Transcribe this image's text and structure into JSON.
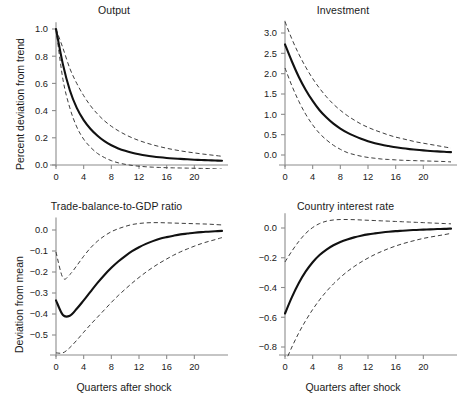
{
  "figure": {
    "width": 458,
    "height": 404,
    "background": "#ffffff",
    "axis_color": "#8c8c8c",
    "mean_color": "#111111",
    "band_color": "#333333"
  },
  "chart_data": [
    {
      "type": "line",
      "panel": "top-left",
      "title": "Output",
      "xlabel": "",
      "ylabel": "Percent deviation from trend",
      "xlim": [
        0,
        24
      ],
      "ylim": [
        -0.08,
        1.05
      ],
      "xticks": [
        0,
        4,
        8,
        12,
        16,
        20
      ],
      "xticklabels": [
        "0",
        "4",
        "8",
        "12",
        "16",
        "20"
      ],
      "yticks": [
        0.0,
        0.2,
        0.4,
        0.6,
        0.8,
        1.0
      ],
      "yticklabels": [
        "0.0",
        "0.2",
        "0.4",
        "0.6",
        "0.8",
        "1.0"
      ],
      "grid": false,
      "legend": "none",
      "x": [
        0,
        1,
        2,
        3,
        4,
        5,
        6,
        7,
        8,
        9,
        10,
        11,
        12,
        13,
        14,
        15,
        16,
        17,
        18,
        19,
        20,
        21,
        22,
        23,
        24
      ],
      "series": [
        {
          "name": "mean",
          "style": "solid",
          "values": [
            1.0,
            0.74,
            0.55,
            0.42,
            0.33,
            0.265,
            0.215,
            0.175,
            0.145,
            0.122,
            0.104,
            0.09,
            0.079,
            0.07,
            0.063,
            0.057,
            0.052,
            0.048,
            0.045,
            0.042,
            0.039,
            0.037,
            0.035,
            0.033,
            0.031
          ]
        },
        {
          "name": "upper-band",
          "style": "dashed",
          "values": [
            1.0,
            0.86,
            0.71,
            0.6,
            0.51,
            0.435,
            0.375,
            0.325,
            0.285,
            0.252,
            0.224,
            0.2,
            0.18,
            0.163,
            0.148,
            0.135,
            0.123,
            0.113,
            0.104,
            0.096,
            0.089,
            0.082,
            0.076,
            0.07,
            0.064
          ]
        },
        {
          "name": "lower-band",
          "style": "dashed",
          "values": [
            1.0,
            0.63,
            0.42,
            0.28,
            0.19,
            0.13,
            0.085,
            0.055,
            0.032,
            0.016,
            0.005,
            -0.003,
            -0.009,
            -0.013,
            -0.016,
            -0.018,
            -0.02,
            -0.021,
            -0.022,
            -0.023,
            -0.024,
            -0.025,
            -0.026,
            -0.028,
            -0.031
          ]
        }
      ]
    },
    {
      "type": "line",
      "panel": "top-right",
      "title": "Investment",
      "xlabel": "",
      "ylabel": "",
      "xlim": [
        0,
        24
      ],
      "ylim": [
        -0.25,
        3.3
      ],
      "xticks": [
        0,
        4,
        8,
        12,
        16,
        20
      ],
      "xticklabels": [
        "0",
        "4",
        "8",
        "12",
        "16",
        "20"
      ],
      "yticks": [
        0.0,
        0.5,
        1.0,
        1.5,
        2.0,
        2.5,
        3.0
      ],
      "yticklabels": [
        "0.0",
        "0.5",
        "1.0",
        "1.5",
        "2.0",
        "2.5",
        "3.0"
      ],
      "grid": false,
      "legend": "none",
      "x": [
        0,
        1,
        2,
        3,
        4,
        5,
        6,
        7,
        8,
        9,
        10,
        11,
        12,
        13,
        14,
        15,
        16,
        17,
        18,
        19,
        20,
        21,
        22,
        23,
        24
      ],
      "series": [
        {
          "name": "mean",
          "style": "solid",
          "values": [
            2.72,
            2.3,
            1.92,
            1.6,
            1.33,
            1.1,
            0.92,
            0.77,
            0.65,
            0.55,
            0.47,
            0.4,
            0.34,
            0.29,
            0.25,
            0.22,
            0.19,
            0.165,
            0.145,
            0.128,
            0.113,
            0.1,
            0.089,
            0.079,
            0.07
          ]
        },
        {
          "name": "upper-band",
          "style": "dashed",
          "values": [
            3.28,
            2.85,
            2.48,
            2.16,
            1.88,
            1.64,
            1.43,
            1.25,
            1.1,
            0.97,
            0.86,
            0.76,
            0.68,
            0.61,
            0.55,
            0.49,
            0.44,
            0.4,
            0.36,
            0.32,
            0.29,
            0.26,
            0.23,
            0.2,
            0.17
          ]
        },
        {
          "name": "lower-band",
          "style": "dashed",
          "values": [
            2.14,
            1.7,
            1.32,
            1.0,
            0.74,
            0.53,
            0.37,
            0.24,
            0.14,
            0.06,
            0.01,
            -0.03,
            -0.06,
            -0.08,
            -0.1,
            -0.11,
            -0.12,
            -0.13,
            -0.135,
            -0.14,
            -0.145,
            -0.15,
            -0.155,
            -0.16,
            -0.17
          ]
        }
      ]
    },
    {
      "type": "line",
      "panel": "bottom-left",
      "title": "Trade-balance-to-GDP ratio",
      "xlabel": "Quarters after shock",
      "ylabel": "Deviation from mean",
      "xlim": [
        0,
        24
      ],
      "ylim": [
        -0.6,
        0.06
      ],
      "xticks": [
        0,
        4,
        8,
        12,
        16,
        20
      ],
      "xticklabels": [
        "0",
        "4",
        "8",
        "12",
        "16",
        "20"
      ],
      "yticks": [
        -0.5,
        -0.4,
        -0.3,
        -0.2,
        -0.1,
        0.0
      ],
      "yticklabels": [
        "−0.5",
        "−0.4",
        "−0.3",
        "−0.2",
        "−0.1",
        "0.0"
      ],
      "grid": false,
      "legend": "none",
      "x": [
        0,
        1,
        2,
        3,
        4,
        5,
        6,
        7,
        8,
        9,
        10,
        11,
        12,
        13,
        14,
        15,
        16,
        17,
        18,
        19,
        20,
        21,
        22,
        23,
        24
      ],
      "series": [
        {
          "name": "mean",
          "style": "solid",
          "values": [
            -0.335,
            -0.405,
            -0.408,
            -0.375,
            -0.335,
            -0.293,
            -0.252,
            -0.214,
            -0.18,
            -0.15,
            -0.124,
            -0.101,
            -0.082,
            -0.066,
            -0.053,
            -0.042,
            -0.034,
            -0.027,
            -0.021,
            -0.017,
            -0.013,
            -0.01,
            -0.008,
            -0.006,
            -0.004
          ]
        },
        {
          "name": "upper-band",
          "style": "dashed",
          "values": [
            -0.105,
            -0.228,
            -0.212,
            -0.17,
            -0.125,
            -0.085,
            -0.053,
            -0.028,
            -0.008,
            0.006,
            0.017,
            0.026,
            0.031,
            0.034,
            0.035,
            0.035,
            0.034,
            0.033,
            0.032,
            0.031,
            0.03,
            0.029,
            0.028,
            0.026,
            0.024
          ]
        },
        {
          "name": "lower-band",
          "style": "dashed",
          "values": [
            -0.585,
            -0.585,
            -0.56,
            -0.525,
            -0.487,
            -0.45,
            -0.415,
            -0.38,
            -0.345,
            -0.312,
            -0.282,
            -0.253,
            -0.226,
            -0.201,
            -0.178,
            -0.157,
            -0.138,
            -0.12,
            -0.104,
            -0.09,
            -0.077,
            -0.065,
            -0.055,
            -0.046,
            -0.036
          ]
        }
      ]
    },
    {
      "type": "line",
      "panel": "bottom-right",
      "title": "Country interest rate",
      "xlabel": "Quarters after shock",
      "ylabel": "",
      "xlim": [
        0,
        24
      ],
      "ylim": [
        -0.92,
        0.1
      ],
      "xticks": [
        0,
        4,
        8,
        12,
        16,
        20
      ],
      "xticklabels": [
        "0",
        "4",
        "8",
        "12",
        "16",
        "20"
      ],
      "yticks": [
        -0.8,
        -0.6,
        -0.4,
        -0.2,
        0.0
      ],
      "yticklabels": [
        "−0.8",
        "−0.6",
        "−0.4",
        "−0.2",
        "0.0"
      ],
      "grid": false,
      "legend": "none",
      "x": [
        0,
        1,
        2,
        3,
        4,
        5,
        6,
        7,
        8,
        9,
        10,
        11,
        12,
        13,
        14,
        15,
        16,
        17,
        18,
        19,
        20,
        21,
        22,
        23,
        24
      ],
      "series": [
        {
          "name": "mean",
          "style": "solid",
          "values": [
            -0.575,
            -0.465,
            -0.37,
            -0.292,
            -0.23,
            -0.182,
            -0.145,
            -0.116,
            -0.094,
            -0.077,
            -0.063,
            -0.052,
            -0.043,
            -0.036,
            -0.03,
            -0.025,
            -0.021,
            -0.018,
            -0.015,
            -0.013,
            -0.011,
            -0.009,
            -0.007,
            -0.006,
            -0.004
          ]
        },
        {
          "name": "upper-band",
          "style": "dashed",
          "values": [
            -0.228,
            -0.155,
            -0.09,
            -0.036,
            0.003,
            0.03,
            0.046,
            0.054,
            0.057,
            0.057,
            0.056,
            0.054,
            0.052,
            0.05,
            0.048,
            0.046,
            0.044,
            0.042,
            0.04,
            0.038,
            0.036,
            0.034,
            0.032,
            0.03,
            0.028
          ]
        },
        {
          "name": "lower-band",
          "style": "dashed",
          "values": [
            -0.905,
            -0.8,
            -0.705,
            -0.622,
            -0.548,
            -0.483,
            -0.426,
            -0.376,
            -0.332,
            -0.293,
            -0.259,
            -0.229,
            -0.202,
            -0.178,
            -0.157,
            -0.138,
            -0.121,
            -0.106,
            -0.093,
            -0.081,
            -0.07,
            -0.061,
            -0.053,
            -0.045,
            -0.036
          ]
        }
      ]
    }
  ]
}
